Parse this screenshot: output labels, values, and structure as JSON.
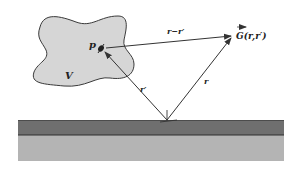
{
  "diagram": {
    "type": "green-function-geometry",
    "labels": {
      "point": "p",
      "volume": "V",
      "difference_vector": "r−r′",
      "green_function": "G(r,r′)",
      "source_vector": "r′",
      "field_vector": "r"
    },
    "colors": {
      "background": "#ffffff",
      "volume_fill": "#d6d6d6",
      "volume_stroke": "#3a3a3a",
      "arrow": "#333333",
      "layer_top": "#6f6f6f",
      "layer_interface": "#2e2e2e",
      "layer_bottom": "#b4b4b4"
    },
    "geometry": {
      "origin": [
        167,
        120
      ],
      "point_p": [
        102,
        48
      ],
      "point_G": [
        232,
        36
      ],
      "substrate": {
        "x": 18,
        "width": 266,
        "top_layer_y": 120,
        "top_layer_height": 15,
        "bottom_layer_y": 135,
        "bottom_layer_height": 26
      }
    }
  }
}
